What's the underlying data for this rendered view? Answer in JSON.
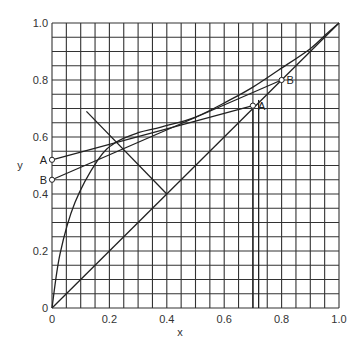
{
  "chart_data": {
    "type": "line",
    "title": "",
    "xlabel": "x",
    "ylabel": "y",
    "xlim": [
      0,
      1.0
    ],
    "ylim": [
      0,
      1.0
    ],
    "grid": true,
    "grid_step": 0.05,
    "x_ticks": [
      {
        "value": 0,
        "label": "0"
      },
      {
        "value": 0.2,
        "label": "0.2"
      },
      {
        "value": 0.4,
        "label": "0.4"
      },
      {
        "value": 0.6,
        "label": "0.6"
      },
      {
        "value": 0.8,
        "label": "0.8"
      },
      {
        "value": 1.0,
        "label": "1.0"
      }
    ],
    "y_ticks": [
      {
        "value": 0,
        "label": "0"
      },
      {
        "value": 0.2,
        "label": "0.2"
      },
      {
        "value": 0.4,
        "label": "0.4"
      },
      {
        "value": 0.6,
        "label": "0.6"
      },
      {
        "value": 0.8,
        "label": "0.8"
      },
      {
        "value": 1.0,
        "label": "1.0"
      }
    ],
    "series": [
      {
        "name": "equilibrium curve",
        "points": [
          [
            0,
            0
          ],
          [
            0.028,
            0.19
          ],
          [
            0.08,
            0.37
          ],
          [
            0.16,
            0.52
          ],
          [
            0.22,
            0.58
          ],
          [
            0.3,
            0.615
          ],
          [
            0.38,
            0.635
          ],
          [
            0.5,
            0.67
          ],
          [
            0.62,
            0.73
          ],
          [
            0.7,
            0.775
          ],
          [
            0.79,
            0.835
          ],
          [
            0.9,
            0.91
          ],
          [
            0.96,
            0.965
          ],
          [
            1.0,
            1.0
          ]
        ]
      },
      {
        "name": "diagonal y=x",
        "points": [
          [
            0,
            0
          ],
          [
            1,
            1
          ]
        ]
      },
      {
        "name": "q-line",
        "points": [
          [
            0.4,
            0.4
          ],
          [
            0.12,
            0.69
          ]
        ]
      },
      {
        "name": "operating line A",
        "points": [
          [
            0,
            0.52
          ],
          [
            0.7,
            0.71
          ]
        ]
      },
      {
        "name": "operating line B",
        "points": [
          [
            0,
            0.45
          ],
          [
            0.8,
            0.8
          ]
        ]
      },
      {
        "name": "vertical at A",
        "points": [
          [
            0.7,
            0
          ],
          [
            0.7,
            0.71
          ]
        ]
      },
      {
        "name": "vertical near A",
        "points": [
          [
            0.72,
            0
          ],
          [
            0.72,
            0.73
          ]
        ]
      }
    ],
    "annotations": [
      {
        "label": "A",
        "x": 0,
        "y": 0.52,
        "side": "left"
      },
      {
        "label": "B",
        "x": 0,
        "y": 0.45,
        "side": "left"
      },
      {
        "label": "A",
        "x": 0.7,
        "y": 0.71,
        "side": "right"
      },
      {
        "label": "B",
        "x": 0.8,
        "y": 0.8,
        "side": "right"
      }
    ]
  }
}
